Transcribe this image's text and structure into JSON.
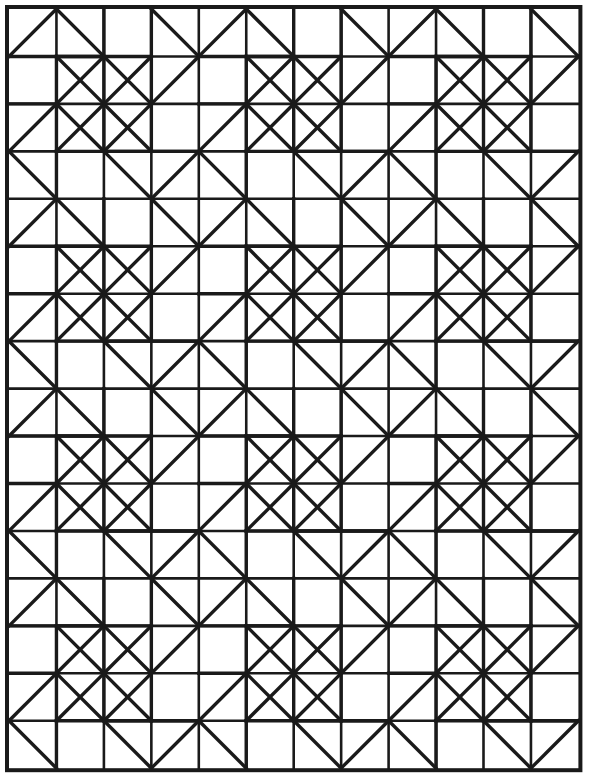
{
  "document": {
    "title": "Pinwheel Quilt Block Geometric Pattern",
    "type": "line-art-pattern",
    "width": 595,
    "height": 783
  },
  "canvas": {
    "background_color": "#ffffff",
    "stroke_color": "#1a1a1a",
    "border_stroke_width": 4,
    "grid_stroke_width": 2.6,
    "diagonal_stroke_width": 3.4
  },
  "grid": {
    "origin_x": 9,
    "origin_y": 9,
    "cell_width": 47.45,
    "cell_height": 47.45,
    "columns": 12,
    "rows": 16,
    "total_width": 569.4,
    "total_height": 759.2,
    "block_size": 4,
    "blocks_across": 3,
    "blocks_down": 4
  },
  "motif": {
    "name": "pinwheel-block",
    "description": "4x4 cell repeating pinwheel with four rotationally symmetric half-square-triangle arms",
    "cell_unit_edges": [
      {
        "r": 0,
        "c": 0,
        "d": "none"
      },
      {
        "r": 0,
        "c": 1,
        "d": "bl-tr"
      },
      {
        "r": 0,
        "c": 2,
        "d": "tl-br"
      },
      {
        "r": 0,
        "c": 3,
        "d": "none"
      }
    ]
  },
  "block_segments": [
    [
      0.0,
      1.0,
      1.0,
      0.0
    ],
    [
      1.0,
      0.0,
      2.0,
      1.0
    ],
    [
      0.0,
      1.0,
      2.0,
      1.0
    ],
    [
      1.0,
      1.0,
      1.0,
      2.0
    ],
    [
      1.0,
      1.0,
      3.0,
      1.0
    ],
    [
      1.0,
      1.0,
      2.0,
      2.0
    ],
    [
      2.0,
      1.0,
      2.0,
      2.0
    ],
    [
      3.0,
      1.0,
      2.0,
      2.0
    ],
    [
      3.0,
      0.0,
      3.0,
      1.0
    ],
    [
      3.0,
      1.0,
      4.0,
      2.0
    ],
    [
      3.0,
      0.0,
      4.0,
      1.0
    ],
    [
      2.0,
      2.0,
      1.0,
      3.0
    ],
    [
      2.0,
      2.0,
      3.0,
      3.0
    ],
    [
      2.0,
      2.0,
      2.0,
      3.0
    ],
    [
      1.0,
      2.0,
      2.0,
      3.0
    ],
    [
      3.0,
      2.0,
      3.0,
      3.0
    ],
    [
      2.0,
      3.0,
      3.0,
      4.0
    ],
    [
      1.0,
      3.0,
      2.0,
      3.0
    ],
    [
      1.0,
      3.0,
      1.0,
      4.0
    ],
    [
      0.0,
      2.0,
      1.0,
      3.0
    ],
    [
      0.0,
      3.0,
      1.0,
      2.0
    ],
    [
      3.0,
      3.0,
      4.0,
      4.0
    ],
    [
      3.0,
      3.0,
      2.0,
      4.0
    ],
    [
      4.0,
      2.0,
      3.0,
      3.0
    ],
    [
      0.0,
      2.0,
      1.0,
      2.0
    ],
    [
      2.0,
      0.0,
      3.0,
      1.0
    ]
  ],
  "interior_grid_lines": {
    "vertical_at_columns": [
      1,
      2,
      3,
      4,
      5,
      6,
      7,
      8,
      9,
      10,
      11
    ],
    "horizontal_at_rows": [
      1,
      2,
      3,
      4,
      5,
      6,
      7,
      8,
      9,
      10,
      11,
      12,
      13,
      14,
      15
    ],
    "note": "grid lines are drawn as partial segments matching the block motif"
  },
  "labels": {
    "caption": ""
  }
}
